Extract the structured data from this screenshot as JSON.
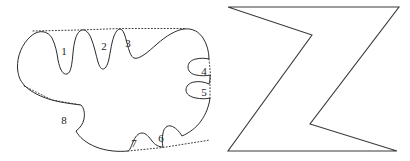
{
  "figure": {
    "title": "",
    "background_color": "#ffffff",
    "stroke_color": "#2b2b2b",
    "hull_stroke_color": "#3a3a3a",
    "polygon_stroke_color": "#3b3b3b",
    "width": 410,
    "height": 161
  },
  "shapes": [
    {
      "id": "blob",
      "name": "concave-blob-with-notches",
      "kind": "closed-curve",
      "notch_count": 8,
      "outline_path": "M 17.5 68 C 17 56 22 44 31 36 C 39 29 48 31 52 38 C 55 44 57 52 58 60 C 60 70 63 75 67 74 C 71 73 72 64 73 53 C 74 42 76 34 80 31 C 84 28 88 31 91 38 C 94 45 96 55 98 62 C 100 69 103 71 106 67 C 109 63 110 52 112 43 C 114 34 117 29 120 29 C 123 29 125 35 127 43 C 129 51 131 57 134 58 C 139 60 148 52 157 44 C 166 36 176 30 184 29 C 193 28 199 32 203 38 C 207 44 209 52 209 59 C 205 58 200 58 196 59 C 191 60 188 63 188 67 C 188 71 191 74 196 75 C 201 76 206 76 210 75 C 210 78 210 81 209 84 C 205 82 199 81 194 82 C 189 83 186 86 186 90 C 186 94 190 97 196 98 C 201 99 206 99 210 98 C 209 106 206 114 201 121 C 196 128 189 133 182 136 C 179 131 175 127 171 126 C 167 125 164 128 163 133 C 162 138 162 143 163 147 C 159 147 155 145 152 141 C 149 137 146 133 142 133 C 138 133 135 137 133 142 C 131 147 130 150 128 151 C 118 152 106 151 96 147 C 86 143 79 137 76 131 C 80 128 83 124 84 119 C 85 113 84 108 81 105 C 74 104 63 103 52 100 C 41 97 31 92 25 86 C 19 80 18 74 17.5 68 Z",
      "hull_segments": [
        {
          "name": "hull-top-segment",
          "path": "M 33 31 L 80 30 L 120 28.5 L 185 28.5"
        },
        {
          "name": "hull-right-segment",
          "path": "M 209 59 L 210.5 75 L 210 84 L 210 98"
        },
        {
          "name": "hull-bottom-segment",
          "path": "M 128 151 L 163 147.5 L 210 140"
        },
        {
          "name": "hull-lower-left-segment",
          "path": "M 24 86 L 52 100 L 81 105"
        }
      ]
    },
    {
      "id": "z-polygon",
      "name": "z-shaped-polygon",
      "kind": "closed-polygon",
      "points": "228,7 399,7 310,124 397,151 228,151 312,35 228,7",
      "vertices": [
        {
          "label": "top-left",
          "x": 228,
          "y": 7
        },
        {
          "label": "top-right",
          "x": 399,
          "y": 7
        },
        {
          "label": "inner-lower",
          "x": 310,
          "y": 124
        },
        {
          "label": "bottom-right",
          "x": 397,
          "y": 151
        },
        {
          "label": "bottom-left",
          "x": 228,
          "y": 151
        },
        {
          "label": "inner-upper",
          "x": 312,
          "y": 35
        }
      ]
    }
  ],
  "labels": [
    {
      "id": "notch-1",
      "text": "1",
      "x": 64,
      "y": 51
    },
    {
      "id": "notch-2",
      "text": "2",
      "x": 104,
      "y": 46
    },
    {
      "id": "notch-3",
      "text": "3",
      "x": 128,
      "y": 43
    },
    {
      "id": "notch-4",
      "text": "4",
      "x": 204,
      "y": 71
    },
    {
      "id": "notch-5",
      "text": "5",
      "x": 204,
      "y": 92
    },
    {
      "id": "notch-6",
      "text": "6",
      "x": 161,
      "y": 138
    },
    {
      "id": "notch-7",
      "text": "7",
      "x": 134,
      "y": 143
    },
    {
      "id": "notch-8",
      "text": "8",
      "x": 64,
      "y": 120
    }
  ]
}
